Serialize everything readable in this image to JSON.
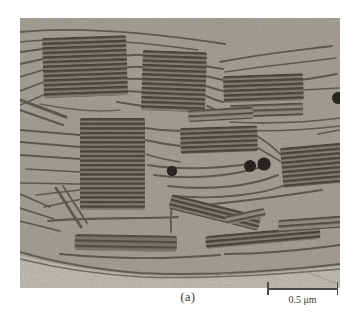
{
  "figure": {
    "panel_label": "(a)"
  },
  "scale_bar": {
    "label": "0.5 μm"
  },
  "colors": {
    "page_background": "#ffffff",
    "stroma_background": "#a8a49b",
    "outside_region": "#c6c4bd",
    "granum_dark_stripe": "#3e3b35",
    "granum_light_stripe": "#857f74",
    "membrane_line": "#56524a",
    "plastoglobule": "#14110d",
    "caption_text": "#2e2c29"
  }
}
